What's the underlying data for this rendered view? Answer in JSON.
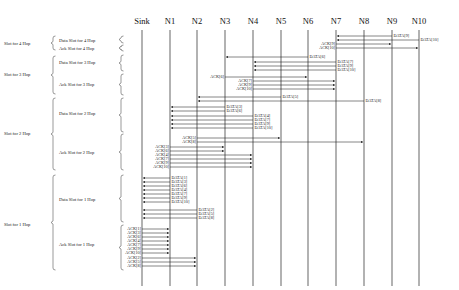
{
  "nodes": [
    {
      "id": "Sink",
      "label": "Sink",
      "x": 142
    },
    {
      "id": "N1",
      "label": "N1",
      "x": 170
    },
    {
      "id": "N2",
      "label": "N2",
      "x": 197
    },
    {
      "id": "N3",
      "label": "N3",
      "x": 225
    },
    {
      "id": "N4",
      "label": "N4",
      "x": 253
    },
    {
      "id": "N5",
      "label": "N5",
      "x": 281
    },
    {
      "id": "N6",
      "label": "N6",
      "x": 308
    },
    {
      "id": "N7",
      "label": "N7",
      "x": 336
    },
    {
      "id": "N8",
      "label": "N8",
      "x": 364
    },
    {
      "id": "N9",
      "label": "N9",
      "x": 392
    },
    {
      "id": "N10",
      "label": "N10",
      "x": 419
    }
  ],
  "lifeline": {
    "top": 30,
    "bottom": 286
  },
  "slot_groups": [
    {
      "label": "Slot for 4 Hop",
      "y": 43,
      "top": 36,
      "bottom": 50,
      "slots": [
        {
          "label": "Data Slot for 4 Hop",
          "y": 40,
          "top": 36,
          "bottom": 43
        },
        {
          "label": "Ack Slot for 4 Hop",
          "y": 48,
          "top": 45,
          "bottom": 51
        }
      ]
    },
    {
      "label": "Slot for 3 Hop",
      "y": 74,
      "top": 56,
      "bottom": 94,
      "slots": [
        {
          "label": "Data Slot for 3 Hop",
          "y": 62,
          "top": 55,
          "bottom": 71
        },
        {
          "label": "Ack Slot for 3 Hop",
          "y": 84,
          "top": 74,
          "bottom": 95
        }
      ]
    },
    {
      "label": "Slot for 2 Hop",
      "y": 133,
      "top": 98,
      "bottom": 170,
      "slots": [
        {
          "label": "Data Slot for 2 Hop",
          "y": 113,
          "top": 98,
          "bottom": 132
        },
        {
          "label": "Ack Slot for 2 Hop",
          "y": 152,
          "top": 134,
          "bottom": 170
        }
      ]
    },
    {
      "label": "Slot for 1 Hop",
      "y": 224,
      "top": 175,
      "bottom": 270,
      "slots": [
        {
          "label": "Data Slot for 1 Hop",
          "y": 199,
          "top": 175,
          "bottom": 222
        },
        {
          "label": "Ack Slot for 1 Hop",
          "y": 244,
          "top": 225,
          "bottom": 270
        }
      ]
    }
  ],
  "messages": [
    {
      "label": "DATA[9]",
      "from": "N9",
      "to": "N7",
      "y": 36
    },
    {
      "label": "DATA[10]",
      "from": "N10",
      "to": "N7",
      "y": 40
    },
    {
      "label": "ACK[9]",
      "from": "N7",
      "to": "N9",
      "y": 44
    },
    {
      "label": "ACK[10]",
      "from": "N7",
      "to": "N10",
      "y": 48
    },
    {
      "label": "DATA[6]",
      "from": "N6",
      "to": "N3",
      "y": 57
    },
    {
      "label": "DATA[7]",
      "from": "N7",
      "to": "N4",
      "y": 62
    },
    {
      "label": "DATA[9]",
      "from": "N7",
      "to": "N4",
      "y": 66
    },
    {
      "label": "DATA[10]",
      "from": "N7",
      "to": "N4",
      "y": 70
    },
    {
      "label": "ACK[6]",
      "from": "N3",
      "to": "N6",
      "y": 77
    },
    {
      "label": "ACK[7]",
      "from": "N4",
      "to": "N7",
      "y": 81
    },
    {
      "label": "ACK[9]",
      "from": "N4",
      "to": "N7",
      "y": 85
    },
    {
      "label": "ACK[10]",
      "from": "N4",
      "to": "N7",
      "y": 89
    },
    {
      "label": "DATA[5]",
      "from": "N5",
      "to": "N2",
      "y": 97
    },
    {
      "label": "DATA[8]",
      "from": "N8",
      "to": "N2",
      "y": 101
    },
    {
      "label": "DATA[3]",
      "from": "N3",
      "to": "N1",
      "y": 107
    },
    {
      "label": "DATA[6]",
      "from": "N3",
      "to": "N1",
      "y": 111
    },
    {
      "label": "DATA[4]",
      "from": "N4",
      "to": "N1",
      "y": 116
    },
    {
      "label": "DATA[7]",
      "from": "N4",
      "to": "N1",
      "y": 120
    },
    {
      "label": "DATA[9]",
      "from": "N4",
      "to": "N1",
      "y": 124
    },
    {
      "label": "DATA[10]",
      "from": "N4",
      "to": "N1",
      "y": 128
    },
    {
      "label": "ACK[5]",
      "from": "N2",
      "to": "N5",
      "y": 138
    },
    {
      "label": "ACK[8]",
      "from": "N2",
      "to": "N8",
      "y": 142
    },
    {
      "label": "ACK[3]",
      "from": "N1",
      "to": "N3",
      "y": 147
    },
    {
      "label": "ACK[6]",
      "from": "N1",
      "to": "N3",
      "y": 151
    },
    {
      "label": "ACK[4]",
      "from": "N1",
      "to": "N4",
      "y": 155
    },
    {
      "label": "ACK[7]",
      "from": "N1",
      "to": "N4",
      "y": 159
    },
    {
      "label": "ACK[9]",
      "from": "N1",
      "to": "N4",
      "y": 163
    },
    {
      "label": "ACK[10]",
      "from": "N1",
      "to": "N4",
      "y": 167
    },
    {
      "label": "DATA[1]",
      "from": "N1",
      "to": "Sink",
      "y": 178
    },
    {
      "label": "DATA[3]",
      "from": "N1",
      "to": "Sink",
      "y": 182
    },
    {
      "label": "DATA[6]",
      "from": "N1",
      "to": "Sink",
      "y": 186
    },
    {
      "label": "DATA[4]",
      "from": "N1",
      "to": "Sink",
      "y": 190
    },
    {
      "label": "DATA[7]",
      "from": "N1",
      "to": "Sink",
      "y": 194
    },
    {
      "label": "DATA[9]",
      "from": "N1",
      "to": "Sink",
      "y": 198
    },
    {
      "label": "DATA[10]",
      "from": "N1",
      "to": "Sink",
      "y": 202
    },
    {
      "label": "DATA[2]",
      "from": "N2",
      "to": "Sink",
      "y": 210
    },
    {
      "label": "DATA[5]",
      "from": "N2",
      "to": "Sink",
      "y": 214
    },
    {
      "label": "DATA[8]",
      "from": "N2",
      "to": "Sink",
      "y": 218
    },
    {
      "label": "ACK[1]",
      "from": "Sink",
      "to": "N1",
      "y": 229
    },
    {
      "label": "ACK[3]",
      "from": "Sink",
      "to": "N1",
      "y": 233
    },
    {
      "label": "ACK[6]",
      "from": "Sink",
      "to": "N1",
      "y": 237
    },
    {
      "label": "ACK[4]",
      "from": "Sink",
      "to": "N1",
      "y": 241
    },
    {
      "label": "ACK[7]",
      "from": "Sink",
      "to": "N1",
      "y": 245
    },
    {
      "label": "ACK[9]",
      "from": "Sink",
      "to": "N1",
      "y": 249
    },
    {
      "label": "ACK[10]",
      "from": "Sink",
      "to": "N1",
      "y": 253
    },
    {
      "label": "ACK[2]",
      "from": "Sink",
      "to": "N2",
      "y": 258
    },
    {
      "label": "ACK[5]",
      "from": "Sink",
      "to": "N2",
      "y": 262
    },
    {
      "label": "ACK[8]",
      "from": "Sink",
      "to": "N2",
      "y": 266
    }
  ],
  "colors": {
    "line": "#222222",
    "text": "#111111",
    "background": "#ffffff"
  }
}
